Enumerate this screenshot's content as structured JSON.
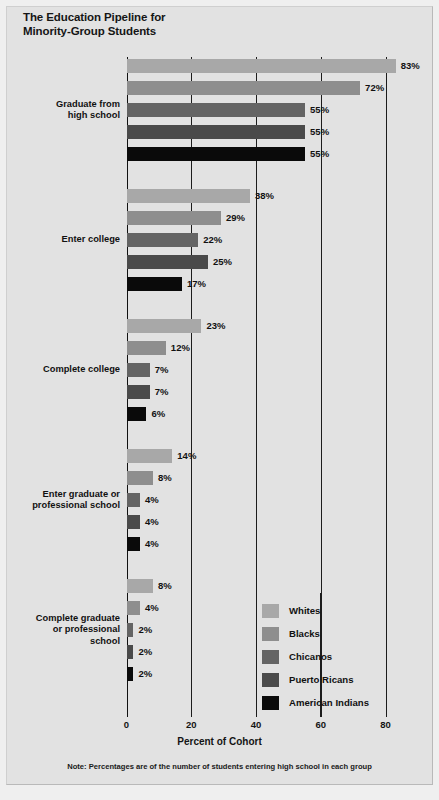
{
  "title": {
    "line1": "The Education Pipeline for",
    "line2": "Minority-Group Students"
  },
  "axis": {
    "xlabel": "Percent of Cohort",
    "ticks": [
      "0",
      "20",
      "40",
      "60",
      "80"
    ]
  },
  "note": "Note: Percentages are of the number of students entering high school in each group",
  "legend": {
    "items": [
      {
        "label": "Whites",
        "color": "#a8a8a8"
      },
      {
        "label": "Blacks",
        "color": "#8e8e8e"
      },
      {
        "label": "Chicanos",
        "color": "#646464"
      },
      {
        "label": "Puerto Ricans",
        "color": "#4a4a4a"
      },
      {
        "label": "American Indians",
        "color": "#0a0a0a"
      }
    ]
  },
  "chart_data": {
    "type": "bar",
    "title": "The Education Pipeline for Minority-Group Students",
    "xlabel": "Percent of Cohort",
    "ylabel": "",
    "xlim": [
      0,
      80
    ],
    "grid": true,
    "legend_position": "bottom-center-right",
    "orientation": "horizontal",
    "categories": [
      "Graduate from high school",
      "Enter college",
      "Complete college",
      "Enter graduate or professional school",
      "Complete graduate or professional school"
    ],
    "category_label_lines": [
      [
        "Graduate from",
        "high school"
      ],
      [
        "Enter college"
      ],
      [
        "Complete college"
      ],
      [
        "Enter graduate or",
        "professional school"
      ],
      [
        "Complete graduate",
        "or professional",
        "school"
      ]
    ],
    "series": [
      {
        "name": "Whites",
        "color": "#a8a8a8",
        "values": [
          83,
          38,
          23,
          14,
          8
        ],
        "labels": [
          "83%",
          "38%",
          "23%",
          "14%",
          "8%"
        ]
      },
      {
        "name": "Blacks",
        "color": "#8e8e8e",
        "values": [
          72,
          29,
          12,
          8,
          4
        ],
        "labels": [
          "72%",
          "29%",
          "12%",
          "8%",
          "4%"
        ]
      },
      {
        "name": "Chicanos",
        "color": "#646464",
        "values": [
          55,
          22,
          7,
          4,
          2
        ],
        "labels": [
          "55%",
          "22%",
          "7%",
          "4%",
          "2%"
        ]
      },
      {
        "name": "Puerto Ricans",
        "color": "#4a4a4a",
        "values": [
          55,
          25,
          7,
          4,
          2
        ],
        "labels": [
          "55%",
          "25%",
          "7%",
          "4%",
          "2%"
        ]
      },
      {
        "name": "American Indians",
        "color": "#0a0a0a",
        "values": [
          55,
          17,
          6,
          4,
          2
        ],
        "labels": [
          "55%",
          "17%",
          "6%",
          "4%",
          "2%"
        ]
      }
    ],
    "note": "Note: Percentages are of the number of students entering high school in each group"
  }
}
